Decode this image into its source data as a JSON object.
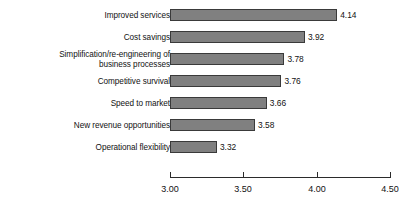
{
  "chart_data": {
    "type": "bar",
    "orientation": "horizontal",
    "title": "",
    "subtitle": "",
    "xlabel": "",
    "ylabel": "",
    "categories": [
      "Improved services",
      "Cost savings",
      "Simplification/re-engineering of\nbusiness processes",
      "Competitive survival",
      "Speed to market",
      "New revenue opportunities",
      "Operational flexibility"
    ],
    "values": [
      4.14,
      3.92,
      3.78,
      3.76,
      3.66,
      3.58,
      3.32
    ],
    "value_labels": [
      "4.14",
      "3.92",
      "3.78",
      "3.76",
      "3.66",
      "3.58",
      "3.32"
    ],
    "xlim": [
      3.0,
      4.5
    ],
    "xticks": [
      3.0,
      3.5,
      4.0,
      4.5
    ],
    "xtick_labels": [
      "3.00",
      "3.50",
      "4.00",
      "4.50"
    ],
    "grid": false,
    "legend": false,
    "legend_position": "none",
    "bar_color": "#808080",
    "bar_border_color": "#3a3a3a",
    "axis_color": "#2b2b2b",
    "text_color": "#121212",
    "background_color": "#ffffff"
  }
}
